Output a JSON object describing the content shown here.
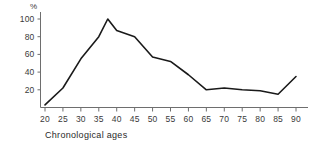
{
  "chart_data": {
    "type": "line",
    "title": "",
    "subtitle": "",
    "xlabel": "Chronological ages",
    "ylabel": "%",
    "unit_symbol": "%",
    "x": [
      20,
      25,
      30,
      35,
      37.5,
      40,
      45,
      50,
      55,
      60,
      65,
      70,
      75,
      80,
      85,
      90
    ],
    "values": [
      3,
      22,
      55,
      80,
      100,
      87,
      80,
      57,
      52,
      37,
      20,
      22,
      20,
      19,
      15,
      35
    ],
    "series": [
      {
        "name": "",
        "values": [
          3,
          22,
          55,
          80,
          100,
          87,
          80,
          57,
          52,
          37,
          20,
          22,
          20,
          19,
          15,
          35
        ]
      }
    ],
    "xticks": [
      20,
      25,
      30,
      35,
      40,
      45,
      50,
      55,
      60,
      65,
      70,
      75,
      80,
      85,
      90
    ],
    "xtick_labels": [
      "20",
      "25",
      "30",
      "35",
      "40",
      "45",
      "50",
      "55",
      "60",
      "65",
      "70",
      "75",
      "80",
      "85",
      "90"
    ],
    "yticks": [
      20,
      40,
      60,
      80,
      100
    ],
    "ytick_labels": [
      "20",
      "40",
      "60",
      "80",
      "100"
    ],
    "xlim": [
      18,
      93
    ],
    "ylim": [
      0,
      104
    ],
    "grid": false,
    "legend": false,
    "legend_position": "none",
    "line_color": "#1a1a1a",
    "axis_color": "#6e6e6e",
    "background_color": "#ffffff"
  }
}
